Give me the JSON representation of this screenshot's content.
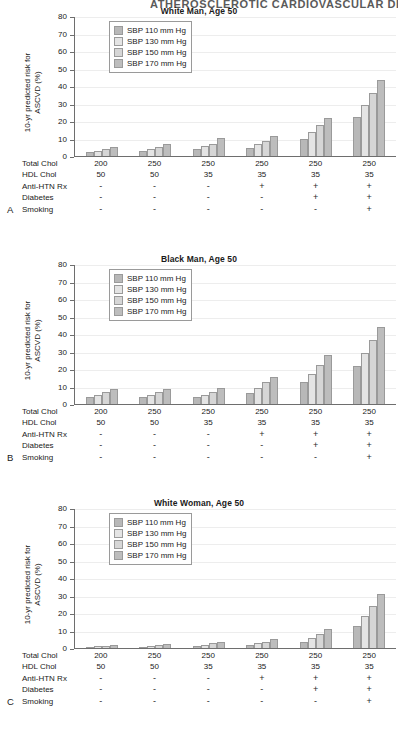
{
  "page_header": "ATHEROSCLEROTIC CARDIOVASCULAR DISEASE",
  "axis": {
    "y_label_line1": "10-yr predicted risk for",
    "y_label_line2": "ASCVD (%)",
    "y_ticks": [
      80,
      70,
      60,
      50,
      40,
      30,
      20,
      10,
      0
    ],
    "ylim": [
      0,
      80
    ]
  },
  "legend": {
    "position": "top-left inside plot",
    "entries": [
      {
        "label": "SBP 110 mm Hg",
        "color": "#b8b8b8"
      },
      {
        "label": "SBP 130 mm Hg",
        "color": "#e4e4e4"
      },
      {
        "label": "SBP 150 mm Hg",
        "color": "#d6d6d6"
      },
      {
        "label": "SBP 170 mm Hg",
        "color": "#bdbdbd"
      }
    ]
  },
  "risk_factor_rows": [
    {
      "label": "Total Chol",
      "values": [
        "200",
        "250",
        "250",
        "250",
        "250",
        "250"
      ]
    },
    {
      "label": "HDL Chol",
      "values": [
        "50",
        "50",
        "35",
        "35",
        "35",
        "35"
      ]
    },
    {
      "label": "Anti-HTN Rx",
      "values": [
        "-",
        "-",
        "-",
        "+",
        "+",
        "+"
      ]
    },
    {
      "label": "Diabetes",
      "values": [
        "-",
        "-",
        "-",
        "-",
        "+",
        "+"
      ]
    },
    {
      "label": "Smoking",
      "values": [
        "-",
        "-",
        "-",
        "-",
        "-",
        "+"
      ]
    }
  ],
  "panels": [
    {
      "letter": "A",
      "title": "White Man, Age 50"
    },
    {
      "letter": "B",
      "title": "Black Man, Age 50"
    },
    {
      "letter": "C",
      "title": "White Woman, Age 50"
    }
  ],
  "chart_data": [
    {
      "type": "bar",
      "panel": "A",
      "title": "White Man, Age 50",
      "xlabel": "",
      "ylabel": "10-yr predicted risk for ASCVD (%)",
      "ylim": [
        0,
        80
      ],
      "grid": true,
      "legend_position": "upper left",
      "categories": [
        "200/50/-/-/-",
        "250/50/-/-/-",
        "250/35/-/-/-",
        "250/35/+/-/-",
        "250/35/+/+/-",
        "250/35/+/+/+"
      ],
      "series": [
        {
          "name": "SBP 110 mm Hg",
          "values": [
            2.2,
            2.8,
            4.2,
            4.7,
            10.0,
            22.2
          ]
        },
        {
          "name": "SBP 130 mm Hg",
          "values": [
            3.0,
            4.0,
            5.7,
            6.7,
            13.5,
            29.3
          ]
        },
        {
          "name": "SBP 150 mm Hg",
          "values": [
            3.8,
            5.2,
            7.0,
            8.5,
            17.5,
            36.2
          ]
        },
        {
          "name": "SBP 170 mm Hg",
          "values": [
            5.1,
            6.9,
            10.1,
            11.3,
            21.8,
            43.3
          ]
        }
      ]
    },
    {
      "type": "bar",
      "panel": "B",
      "title": "Black Man, Age 50",
      "xlabel": "",
      "ylabel": "10-yr predicted risk for ASCVD (%)",
      "ylim": [
        0,
        80
      ],
      "grid": true,
      "legend_position": "upper left",
      "categories": [
        "200/50/-/-/-",
        "250/50/-/-/-",
        "250/35/-/-/-",
        "250/35/+/-/-",
        "250/35/+/+/-",
        "250/35/+/+/+"
      ],
      "series": [
        {
          "name": "SBP 110 mm Hg",
          "values": [
            4.0,
            3.9,
            4.0,
            6.5,
            12.4,
            21.5
          ]
        },
        {
          "name": "SBP 130 mm Hg",
          "values": [
            5.0,
            4.9,
            5.3,
            9.0,
            17.3,
            28.9
          ]
        },
        {
          "name": "SBP 150 mm Hg",
          "values": [
            6.6,
            6.9,
            7.0,
            12.3,
            22.4,
            36.4
          ]
        },
        {
          "name": "SBP 170 mm Hg",
          "values": [
            8.5,
            8.8,
            9.2,
            15.6,
            27.9,
            43.9
          ]
        }
      ]
    },
    {
      "type": "bar",
      "panel": "C",
      "title": "White Woman, Age 50",
      "xlabel": "",
      "ylabel": "10-yr predicted risk for ASCVD (%)",
      "ylim": [
        0,
        80
      ],
      "grid": true,
      "legend_position": "upper left",
      "categories": [
        "200/50/-/-/-",
        "250/50/-/-/-",
        "250/35/-/-/-",
        "250/35/+/-/-",
        "250/35/+/+/-",
        "250/35/+/+/+"
      ],
      "series": [
        {
          "name": "SBP 110 mm Hg",
          "values": [
            0.7,
            0.8,
            1.2,
            1.5,
            3.6,
            12.6
          ]
        },
        {
          "name": "SBP 130 mm Hg",
          "values": [
            1.1,
            1.4,
            1.9,
            2.8,
            5.5,
            18.3
          ]
        },
        {
          "name": "SBP 150 mm Hg",
          "values": [
            1.3,
            1.8,
            2.6,
            3.4,
            7.9,
            24.2
          ]
        },
        {
          "name": "SBP 170 mm Hg",
          "values": [
            1.8,
            2.3,
            3.7,
            5.0,
            10.8,
            30.6
          ]
        }
      ]
    }
  ]
}
